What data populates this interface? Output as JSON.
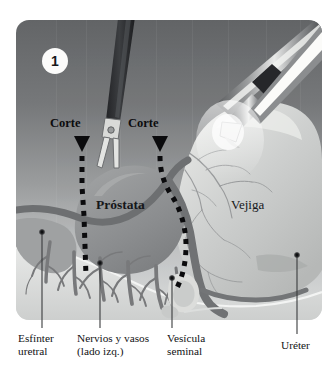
{
  "figure": {
    "step_number": "1",
    "frame": {
      "background_top_color": "#6e7072",
      "background_bottom_color": "#cfd1d2",
      "corner_radius_px": 13
    },
    "cut_markers": [
      {
        "name": "cut-left",
        "label": "Corte",
        "x": 50,
        "y": 112,
        "arrow_x": 66,
        "arrow_y": 128
      },
      {
        "name": "cut-right",
        "label": "Corte",
        "x": 128,
        "y": 112,
        "arrow_x": 144,
        "arrow_y": 128
      }
    ],
    "organ_labels": [
      {
        "name": "prostate-label",
        "text": "Próstata",
        "x": 93,
        "y": 192,
        "bold": true
      },
      {
        "name": "bladder-label",
        "text": "Vejiga",
        "x": 228,
        "y": 190,
        "bold": false
      }
    ],
    "callouts": [
      {
        "name": "urethral-sphincter",
        "text": "Esfínter\nuretral",
        "caption_x": 18,
        "caption_y": 334,
        "dot_x": 42,
        "dot_y": 232,
        "line_x": 42,
        "line_top": 232,
        "line_bottom": 328
      },
      {
        "name": "nerves-and-vessels",
        "text": "Nervios y vasos\n(lado izq.)",
        "caption_x": 78,
        "caption_y": 334,
        "dot_x": 100,
        "dot_y": 263,
        "line_x": 100,
        "line_top": 263,
        "line_bottom": 328
      },
      {
        "name": "seminal-vesicle",
        "text": "Vesícula\nseminal",
        "caption_x": 168,
        "caption_y": 334,
        "dot_x": 172,
        "dot_y": 278,
        "line_x": 172,
        "line_top": 278,
        "line_bottom": 328
      },
      {
        "name": "ureter",
        "text": "Uréter",
        "caption_x": 283,
        "caption_y": 341,
        "dot_x": 297,
        "dot_y": 255,
        "line_x": 297,
        "line_top": 255,
        "line_bottom": 334
      }
    ],
    "instruments": [
      {
        "name": "scissors-instrument",
        "position": "upper-center-left",
        "state": "open-jaws"
      },
      {
        "name": "grasper-instrument",
        "position": "upper-right",
        "state": "shaft"
      },
      {
        "name": "retractor-instrument",
        "position": "upper-right-outer",
        "state": "shaft"
      }
    ],
    "anatomy": {
      "prostate": {
        "color": "#8e9092"
      },
      "bladder": {
        "color": "#c6c8c7"
      },
      "vessels": {
        "color": "#6c6e70"
      },
      "cut_line_color": "#0b0b0d"
    }
  }
}
